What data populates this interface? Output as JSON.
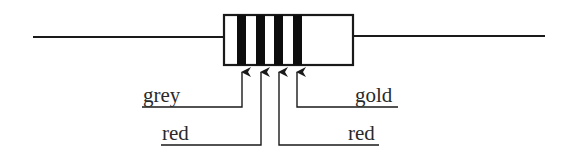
{
  "diagram": {
    "component": "resistor",
    "colors": {
      "stroke": "#1a1a1a",
      "band": "#0d0d0d",
      "body_fill": "#ffffff",
      "text": "#2a2a2a"
    },
    "bands": [
      {
        "index": 1,
        "color_name": "grey"
      },
      {
        "index": 2,
        "color_name": "red"
      },
      {
        "index": 3,
        "color_name": "red"
      },
      {
        "index": 4,
        "color_name": "gold"
      }
    ],
    "labels": {
      "band1": "grey",
      "band2": "red",
      "band3": "red",
      "band4": "gold"
    }
  }
}
